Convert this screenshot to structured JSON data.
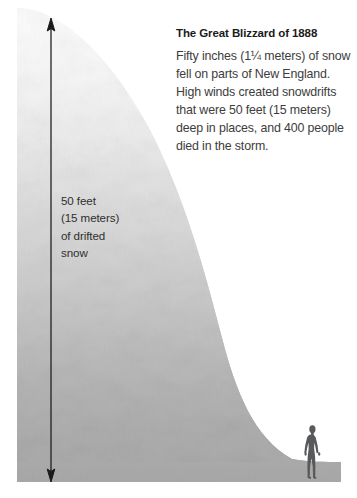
{
  "graphic": {
    "kind": "snow-drift-scale-illustration",
    "canvas": {
      "width": 357,
      "height": 498
    },
    "background_color": "#ffffff"
  },
  "callout": {
    "title": "The Great Blizzard of 1888",
    "body": "Fifty inches (1¼ meters) of snow fell on parts of New England. High winds created snowdrifts that were 50 feet (15 meters) deep in places, and 400 people died in the storm.",
    "body_lines": [
      "Fifty inches (1¼ meters) of",
      "snow fell on parts of New",
      "England. High winds created",
      "snowdrifts that were 50 feet",
      "(15 meters) deep in places,",
      "and 400 people died in",
      "the storm."
    ],
    "title_color": "#1b1b1b",
    "body_color": "#3d3d3d"
  },
  "measurement": {
    "label": "50 feet\n(15 meters)\nof drifted\nsnow",
    "label_lines": [
      "50 feet",
      "(15 meters)",
      "of drifted",
      "snow"
    ],
    "value_feet": 50,
    "value_meters": 15,
    "label_color": "#2f2f2f",
    "arrow_color": "#1a1a1a",
    "arrow_top_y": 25,
    "arrow_bottom_y": 476,
    "arrow_x": 51
  },
  "snowdrift": {
    "description": "drifted snow bank, tall at left, curving down to ground at right",
    "gradient_top_color": "#fcfcfc",
    "gradient_mid_color": "#d6d6d6",
    "gradient_bottom_color": "#a9a9a9",
    "left_edge_x": 17,
    "peak_y": 8,
    "toe_x": 292
  },
  "ground": {
    "description": "flat ground strip at base of scene",
    "color": "#a9a9a9",
    "top_y": 462,
    "bottom_y": 482,
    "left_x": 17,
    "right_x": 341
  },
  "human_figure": {
    "description": "adult person silhouette for scale",
    "color": "#58595b",
    "x": 305,
    "top_y": 425,
    "bottom_y": 479,
    "height_px": 54
  },
  "colors": {
    "white": "#ffffff",
    "snow_light": "#fcfcfc",
    "snow_dark": "#a9a9a9",
    "ink": "#1b1b1b",
    "body_ink": "#3d3d3d",
    "silhouette": "#58595b"
  }
}
